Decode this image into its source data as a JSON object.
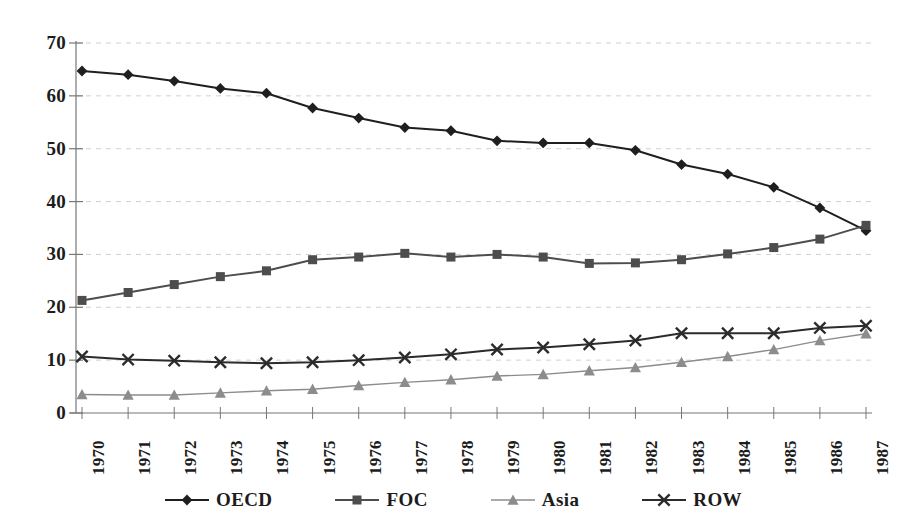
{
  "chart_data": {
    "type": "line",
    "title": "",
    "xlabel": "",
    "ylabel": "",
    "categories": [
      "1970",
      "1971",
      "1972",
      "1973",
      "1974",
      "1975",
      "1976",
      "1977",
      "1978",
      "1979",
      "1980",
      "1981",
      "1982",
      "1983",
      "1984",
      "1985",
      "1986",
      "1987"
    ],
    "ylim": [
      0,
      70
    ],
    "yticks": [
      0,
      10,
      20,
      30,
      40,
      50,
      60,
      70
    ],
    "grid": true,
    "legend_position": "bottom",
    "series": [
      {
        "name": "OECD",
        "marker": "diamond",
        "color": "#1f1f1f",
        "values": [
          64.7,
          64.0,
          62.8,
          61.4,
          60.5,
          57.7,
          55.8,
          54.0,
          53.4,
          51.5,
          51.1,
          51.1,
          49.7,
          47.0,
          45.2,
          42.7,
          38.8,
          34.5
        ]
      },
      {
        "name": "FOC",
        "marker": "square",
        "color": "#4d4d4d",
        "values": [
          21.3,
          22.8,
          24.3,
          25.8,
          26.9,
          29.0,
          29.5,
          30.2,
          29.5,
          30.0,
          29.5,
          28.3,
          28.4,
          29.0,
          30.1,
          31.3,
          32.9,
          35.5
        ]
      },
      {
        "name": "Asia",
        "marker": "triangle",
        "color": "#8c8c8c",
        "values": [
          3.5,
          3.4,
          3.4,
          3.8,
          4.2,
          4.5,
          5.2,
          5.8,
          6.3,
          7.0,
          7.3,
          8.0,
          8.6,
          9.6,
          10.7,
          12.0,
          13.7,
          15.0
        ]
      },
      {
        "name": "ROW",
        "marker": "cross",
        "color": "#2b2b2b",
        "values": [
          10.7,
          10.1,
          9.9,
          9.6,
          9.4,
          9.6,
          10.0,
          10.5,
          11.1,
          12.0,
          12.4,
          13.0,
          13.7,
          15.1,
          15.1,
          15.1,
          16.1,
          16.5
        ]
      }
    ]
  },
  "axes": {
    "y_tick_labels": [
      "0",
      "10",
      "20",
      "30",
      "40",
      "50",
      "60",
      "70"
    ],
    "x_tick_labels": [
      "1970",
      "1971",
      "1972",
      "1973",
      "1974",
      "1975",
      "1976",
      "1977",
      "1978",
      "1979",
      "1980",
      "1981",
      "1982",
      "1983",
      "1984",
      "1985",
      "1986",
      "1987"
    ]
  },
  "legend": {
    "items": [
      {
        "label": "OECD",
        "marker": "diamond-marker-icon"
      },
      {
        "label": "FOC",
        "marker": "square-marker-icon"
      },
      {
        "label": "Asia",
        "marker": "triangle-marker-icon"
      },
      {
        "label": "ROW",
        "marker": "cross-marker-icon"
      }
    ]
  },
  "style": {
    "axis_color": "#777777",
    "grid_color": "#d0d0d0",
    "background": "#ffffff"
  }
}
